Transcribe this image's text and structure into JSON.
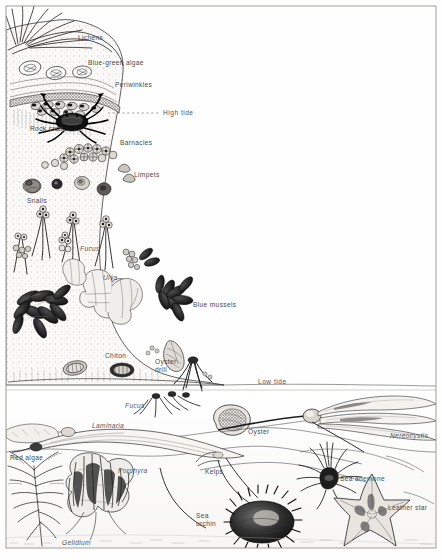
{
  "figure": {
    "background_color": "#fefefe",
    "ink_color": "#2b2b2b",
    "label_color": "#4a4a4a",
    "frame": {
      "x": 6,
      "y": 6,
      "width": 430,
      "height": 542,
      "stroke": "#9a958c"
    }
  },
  "tide_lines": [
    {
      "name": "high-tide",
      "label": "High tide",
      "y": 113,
      "x_start": 108,
      "x_end": 160,
      "style": "dotted"
    },
    {
      "name": "low-tide",
      "label": "Low tide",
      "y": 386,
      "x_start": 224,
      "x_end": 436,
      "style": "solid"
    }
  ],
  "labels": [
    {
      "id": "lichens",
      "text": "Lichens",
      "x": 78,
      "y": 38,
      "italic": false
    },
    {
      "id": "blue-green-algae",
      "text": "Blue-green algae",
      "x": 88,
      "y": 63,
      "italic": false
    },
    {
      "id": "periwinkles",
      "text": "Periwinkles",
      "x": 115,
      "y": 85,
      "italic": false
    },
    {
      "id": "high-tide",
      "text": "High tide",
      "x": 163,
      "y": 110,
      "italic": false
    },
    {
      "id": "rock-crab",
      "text": "Rock crab",
      "x": 30,
      "y": 129,
      "italic": false
    },
    {
      "id": "barnacles",
      "text": "Barnacles",
      "x": 120,
      "y": 143,
      "italic": false
    },
    {
      "id": "limpets",
      "text": "Limpets",
      "x": 134,
      "y": 175,
      "italic": false
    },
    {
      "id": "snails",
      "text": "Snails",
      "x": 27,
      "y": 201,
      "italic": false
    },
    {
      "id": "fucus-upper",
      "text": "Fucus",
      "x": 80,
      "y": 249,
      "italic": true
    },
    {
      "id": "ulva",
      "text": "Ulva",
      "x": 103,
      "y": 278,
      "italic": true
    },
    {
      "id": "blue-mussels",
      "text": "Blue mussels",
      "x": 193,
      "y": 305,
      "italic": false
    },
    {
      "id": "chiton",
      "text": "Chiton",
      "x": 108,
      "y": 356,
      "italic": false
    },
    {
      "id": "oyster-drill",
      "text": "Oyster drill",
      "x": 155,
      "y": 365,
      "italic": false,
      "two_line": true
    },
    {
      "id": "low-tide",
      "text": "Low tide",
      "x": 258,
      "y": 382,
      "italic": false
    },
    {
      "id": "fucus-lower",
      "text": "Fucus",
      "x": 125,
      "y": 406,
      "italic": true
    },
    {
      "id": "laminaria",
      "text": "Laminaria",
      "x": 92,
      "y": 426,
      "italic": true
    },
    {
      "id": "oyster",
      "text": "Oyster",
      "x": 248,
      "y": 432,
      "italic": false
    },
    {
      "id": "nereocystis",
      "text": "Nereocystis",
      "x": 392,
      "y": 436,
      "italic": true
    },
    {
      "id": "red-algae",
      "text": "Red algae",
      "x": 10,
      "y": 458,
      "italic": false
    },
    {
      "id": "porphyra",
      "text": "Porphyra",
      "x": 118,
      "y": 471,
      "italic": true
    },
    {
      "id": "kelps",
      "text": "Kelps",
      "x": 205,
      "y": 472,
      "italic": false
    },
    {
      "id": "sea-anemone",
      "text": "Sea anemone",
      "x": 340,
      "y": 479,
      "italic": false
    },
    {
      "id": "leather-star",
      "text": "Leather star",
      "x": 390,
      "y": 508,
      "italic": false
    },
    {
      "id": "sea-urchin",
      "text": "Sea urchin",
      "x": 196,
      "y": 516,
      "italic": false,
      "two_line": true
    },
    {
      "id": "gelidium",
      "text": "Gelidium",
      "x": 62,
      "y": 543,
      "italic": true
    }
  ],
  "zones": [
    {
      "name": "splash-zone",
      "organisms": [
        "Lichens",
        "Blue-green algae",
        "Periwinkles"
      ]
    },
    {
      "name": "upper-intertidal",
      "organisms": [
        "Rock crab",
        "Barnacles",
        "Limpets",
        "Snails"
      ]
    },
    {
      "name": "mid-intertidal",
      "organisms": [
        "Fucus",
        "Ulva",
        "Blue mussels",
        "Chiton",
        "Oyster drill"
      ]
    },
    {
      "name": "lower-intertidal",
      "organisms": [
        "Fucus",
        "Laminaria",
        "Oyster",
        "Red algae",
        "Porphyra",
        "Gelidium"
      ]
    },
    {
      "name": "subtidal",
      "organisms": [
        "Nereocystis",
        "Kelps",
        "Sea anemone",
        "Leather star",
        "Sea urchin"
      ]
    }
  ]
}
